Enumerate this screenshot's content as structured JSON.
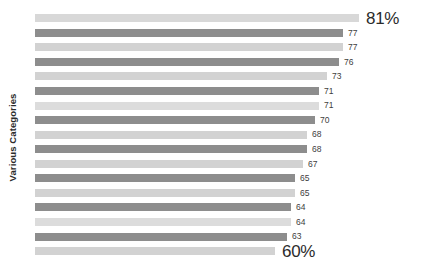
{
  "chart_data": {
    "type": "bar",
    "orientation": "horizontal",
    "title": "",
    "xlabel": "",
    "ylabel": "Various Categories",
    "grid": false,
    "legend": null,
    "xlim": [
      0,
      85
    ],
    "categories": [
      "1",
      "2",
      "3",
      "4",
      "5",
      "6",
      "7",
      "8",
      "9",
      "10",
      "11",
      "12",
      "13",
      "14",
      "15",
      "16",
      "17"
    ],
    "values": [
      81,
      77,
      77,
      76,
      73,
      71,
      71,
      70,
      68,
      68,
      67,
      65,
      65,
      64,
      64,
      63,
      60
    ],
    "data_labels": [
      "81%",
      "77",
      "77",
      "76",
      "73",
      "71",
      "71",
      "70",
      "68",
      "68",
      "67",
      "65",
      "65",
      "64",
      "64",
      "63",
      "60%"
    ],
    "bars": [
      {
        "value": 81,
        "label": "81%",
        "color": "#d8d8d8",
        "emphasis": true
      },
      {
        "value": 77,
        "label": "77",
        "color": "#8d8d8d",
        "emphasis": false
      },
      {
        "value": 77,
        "label": "77",
        "color": "#d2d2d2",
        "emphasis": false
      },
      {
        "value": 76,
        "label": "76",
        "color": "#8d8d8d",
        "emphasis": false
      },
      {
        "value": 73,
        "label": "73",
        "color": "#d2d2d2",
        "emphasis": false
      },
      {
        "value": 71,
        "label": "71",
        "color": "#8d8d8d",
        "emphasis": false
      },
      {
        "value": 71,
        "label": "71",
        "color": "#dcdcdc",
        "emphasis": false
      },
      {
        "value": 70,
        "label": "70",
        "color": "#8d8d8d",
        "emphasis": false
      },
      {
        "value": 68,
        "label": "68",
        "color": "#d2d2d2",
        "emphasis": false
      },
      {
        "value": 68,
        "label": "68",
        "color": "#8d8d8d",
        "emphasis": false
      },
      {
        "value": 67,
        "label": "67",
        "color": "#d2d2d2",
        "emphasis": false
      },
      {
        "value": 65,
        "label": "65",
        "color": "#8d8d8d",
        "emphasis": false
      },
      {
        "value": 65,
        "label": "65",
        "color": "#d2d2d2",
        "emphasis": false
      },
      {
        "value": 64,
        "label": "64",
        "color": "#8d8d8d",
        "emphasis": false
      },
      {
        "value": 64,
        "label": "64",
        "color": "#dcdcdc",
        "emphasis": false
      },
      {
        "value": 63,
        "label": "63",
        "color": "#8d8d8d",
        "emphasis": false
      },
      {
        "value": 60,
        "label": "60%",
        "color": "#d2d2d2",
        "emphasis": true
      }
    ],
    "colors": {
      "bar_light": "#d2d2d2",
      "bar_dark": "#8d8d8d",
      "label_text": "#404040",
      "emphasis_text": "#2b2b2b",
      "background": "#ffffff"
    }
  }
}
